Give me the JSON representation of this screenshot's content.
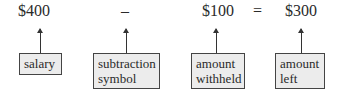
{
  "equation": {
    "terms": [
      {
        "value": "$400",
        "label": "salary"
      },
      {
        "value": "–",
        "label": "subtraction symbol"
      },
      {
        "value": "$100",
        "label": "amount withheld"
      },
      {
        "value": "=",
        "label": ""
      },
      {
        "value": "$300",
        "label": "amount left"
      }
    ]
  },
  "labels": {
    "salary": "salary",
    "subtraction_line1": "subtraction",
    "subtraction_line2": "symbol",
    "withheld_line1": "amount",
    "withheld_line2": "withheld",
    "left_line1": "amount",
    "left_line2": "left"
  },
  "colors": {
    "box_fill": "#ececec",
    "box_border": "#444444",
    "text": "#2a2a2a"
  }
}
